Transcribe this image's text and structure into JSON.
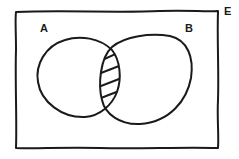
{
  "diagram": {
    "type": "venn",
    "universe_label": "E",
    "sets": [
      {
        "id": "A",
        "label": "A"
      },
      {
        "id": "B",
        "label": "B"
      }
    ],
    "shaded_region": "A ∩ B",
    "hatch_lines": 5,
    "colors": {
      "stroke": "#1a1a1a",
      "background": "#ffffff"
    }
  }
}
